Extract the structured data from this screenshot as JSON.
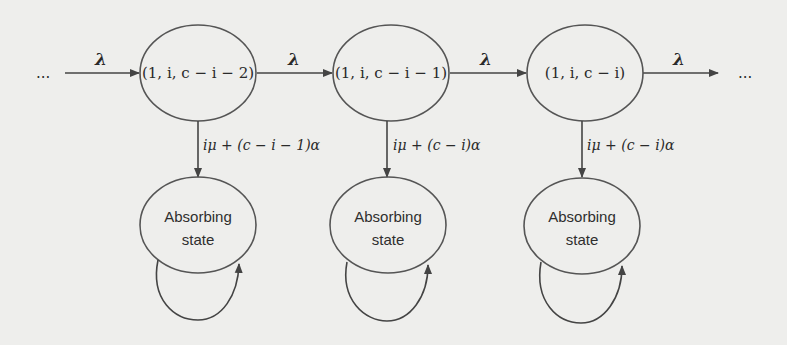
{
  "diagram": {
    "type": "state-transition",
    "leading_ellipsis": "...",
    "trailing_ellipsis": "...",
    "transient_states": [
      {
        "label": "(1, i, c − i − 2)",
        "rate_down": "iμ + (c − i − 1)α"
      },
      {
        "label": "(1, i, c − i − 1)",
        "rate_down": "iμ + (c − i)α"
      },
      {
        "label": "(1, i, c − i)",
        "rate_down": "iμ + (c − i)α"
      }
    ],
    "horizontal_rate": "λ",
    "horizontal_edges": [
      {
        "from": "...",
        "to": "(1, i, c − i − 2)",
        "label": "λ"
      },
      {
        "from": "(1, i, c − i − 2)",
        "to": "(1, i, c − i − 1)",
        "label": "λ"
      },
      {
        "from": "(1, i, c − i − 1)",
        "to": "(1, i, c − i)",
        "label": "λ"
      },
      {
        "from": "(1, i, c − i)",
        "to": "...",
        "label": "λ"
      }
    ],
    "absorbing_states": [
      {
        "line1": "Absorbing",
        "line2": "state",
        "self_loop": true
      },
      {
        "line1": "Absorbing",
        "line2": "state",
        "self_loop": true
      },
      {
        "line1": "Absorbing",
        "line2": "state",
        "self_loop": true
      }
    ],
    "colors": {
      "background": "#eeeeec",
      "stroke": "#555555",
      "text": "#2a2a2a"
    }
  }
}
